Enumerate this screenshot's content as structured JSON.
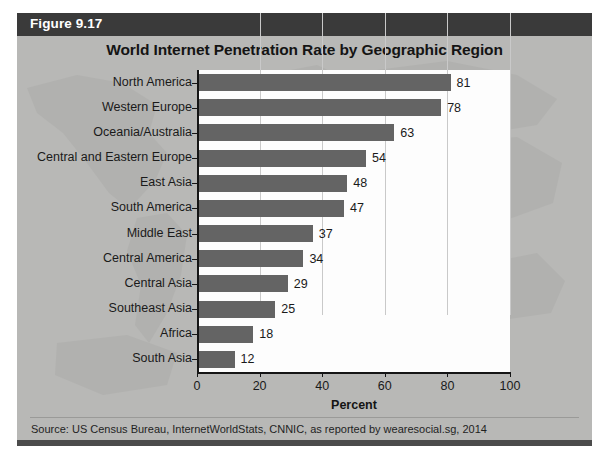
{
  "figure": {
    "label": "Figure 9.17",
    "source": "Source: US Census Bureau, InternetWorldStats, CNNIC, as reported by wearesocial.sg, 2014"
  },
  "colors": {
    "panel_background": "#b8b8b6",
    "header_bar": "#3a3a3a",
    "bar_fill": "#646464",
    "plot_background": "#fdfdfd",
    "gridline": "#c9c9c9",
    "axis": "#151515"
  },
  "chart_data": {
    "type": "bar",
    "orientation": "horizontal",
    "title": "World Internet Penetration Rate by Geographic Region",
    "xlabel": "Percent",
    "ylabel": "",
    "xlim": [
      0,
      100
    ],
    "xticks": [
      0,
      20,
      40,
      60,
      80,
      100
    ],
    "grid": "vertical",
    "legend": "none",
    "categories": [
      "North America",
      "Western Europe",
      "Oceania/Australia",
      "Central and Eastern Europe",
      "East Asia",
      "South America",
      "Middle East",
      "Central America",
      "Central Asia",
      "Southeast Asia",
      "Africa",
      "South Asia"
    ],
    "values": [
      81,
      78,
      63,
      54,
      48,
      47,
      37,
      34,
      29,
      25,
      18,
      12
    ],
    "data_labels": [
      "81",
      "78",
      "63",
      "54",
      "48",
      "47",
      "37",
      "34",
      "29",
      "25",
      "18",
      "12"
    ],
    "tick_labels": [
      "0",
      "20",
      "40",
      "60",
      "80",
      "100"
    ]
  }
}
